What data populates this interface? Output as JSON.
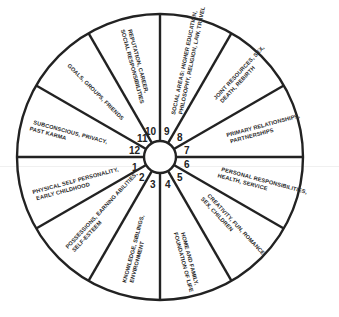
{
  "diagram": {
    "type": "astrological-houses-wheel",
    "colors": {
      "line": "#222222",
      "background": "#ffffff",
      "text": "#2a2a2a"
    },
    "houses": [
      {
        "number": "1",
        "lines": [
          "PHYSICAL SELF PERSONALITY,",
          "EARLY CHILDHOOD"
        ]
      },
      {
        "number": "2",
        "lines": [
          "POSSESSIONS, EARNING ABILITIES,",
          "SELF-ESTEEM"
        ]
      },
      {
        "number": "3",
        "lines": [
          "KNOWLEDGE, SIBLINGS,",
          "ENVIRONMENT"
        ]
      },
      {
        "number": "4",
        "lines": [
          "HOME AND FAMILY,",
          "FOUNDATION OF LIFE"
        ]
      },
      {
        "number": "5",
        "lines": [
          "CREATIVITY, FUN, ROMANCE,",
          "SEX, CHILDREN"
        ]
      },
      {
        "number": "6",
        "lines": [
          "PERSONAL RESPONSIBILITIES,",
          "HEALTH, SERVICE"
        ]
      },
      {
        "number": "7",
        "lines": [
          "PRIMARY RELATIONSHIPS,",
          "PARTNERSHIPS"
        ]
      },
      {
        "number": "8",
        "lines": [
          "JOINT RESOURCES, SEX,",
          "DEATH, REBIRTH"
        ]
      },
      {
        "number": "9",
        "lines": [
          "SOCIAL AREAS: HIGHER EDUCATION,",
          "PHILOSOPHY, RELIGION, LAW, TRAVEL"
        ]
      },
      {
        "number": "10",
        "lines": [
          "REPUTATION, CAREER,",
          "SOCIAL RESPONSIBILITIES"
        ]
      },
      {
        "number": "11",
        "lines": [
          "GOALS, GROUPS, FRIENDS"
        ]
      },
      {
        "number": "12",
        "lines": [
          "SUBCONSCIOUS, PRIVACY,",
          "PAST KARMA"
        ]
      }
    ]
  }
}
